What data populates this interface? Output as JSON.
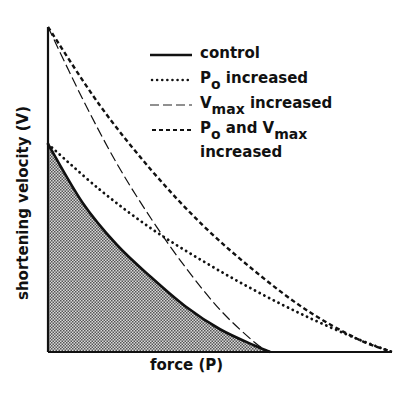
{
  "chart_data": {
    "type": "line",
    "title": "",
    "xlabel": "force (P)",
    "ylabel": "shortening velocity (V)",
    "grid": false,
    "legend_position": "upper right (inside)",
    "x_range_relative": [
      0,
      1
    ],
    "y_range_relative": [
      0,
      1
    ],
    "series": [
      {
        "name": "control",
        "style": "solid",
        "shaded_area_below": true,
        "x": [
          0,
          0.1,
          0.2,
          0.3,
          0.4,
          0.5,
          0.6,
          0.646
        ],
        "y": [
          0.64,
          0.46,
          0.33,
          0.23,
          0.14,
          0.07,
          0.02,
          0
        ]
      },
      {
        "name": "Po increased",
        "style": "dotted",
        "x": [
          0,
          0.15,
          0.3,
          0.45,
          0.6,
          0.75,
          0.9,
          1.0
        ],
        "y": [
          0.64,
          0.5,
          0.38,
          0.28,
          0.19,
          0.11,
          0.04,
          0
        ]
      },
      {
        "name": "Vmax increased",
        "style": "long-dash",
        "x": [
          0,
          0.1,
          0.2,
          0.3,
          0.4,
          0.5,
          0.6,
          0.646
        ],
        "y": [
          1.0,
          0.78,
          0.58,
          0.41,
          0.26,
          0.13,
          0.03,
          0
        ]
      },
      {
        "name": "Po and Vmax increased",
        "style": "short-dash",
        "x": [
          0,
          0.15,
          0.3,
          0.45,
          0.6,
          0.75,
          0.9,
          1.0
        ],
        "y": [
          1.0,
          0.76,
          0.56,
          0.39,
          0.25,
          0.13,
          0.04,
          0
        ]
      }
    ]
  },
  "legend": {
    "items": [
      {
        "label": "control"
      },
      {
        "label_main": "P",
        "label_sub": "o",
        "label_rest": " increased"
      },
      {
        "label_main": "V",
        "label_sub": "max",
        "label_rest": " increased"
      },
      {
        "label_main": "P",
        "label_sub": "o",
        "label_mid": " and V",
        "label_sub2": "max",
        "label_line2": "increased"
      }
    ]
  },
  "axes": {
    "x_label": "force (P)",
    "y_label": "shortening velocity (V)"
  }
}
